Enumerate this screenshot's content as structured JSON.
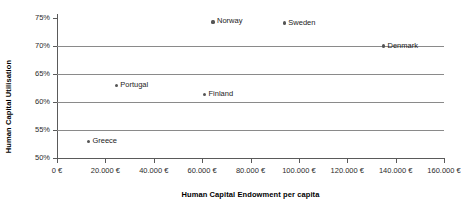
{
  "chart_data": {
    "type": "scatter",
    "title": "",
    "xlabel": "Human Capital Endowment per capita",
    "ylabel": "Human Capital Utilisation",
    "xlim": [
      0,
      160000
    ],
    "ylim": [
      50,
      75
    ],
    "grid": true,
    "gridlines_y": [
      55,
      60,
      65,
      70
    ],
    "legend": "none",
    "xticks": [
      0,
      20000,
      40000,
      60000,
      80000,
      100000,
      120000,
      140000,
      160000
    ],
    "xticklabels": [
      "0 €",
      "20.000 €",
      "40.000 €",
      "60.000 €",
      "80.000 €",
      "100.000 €",
      "120.000 €",
      "140.000 €",
      "160.000 €"
    ],
    "yticks": [
      50,
      55,
      60,
      65,
      70,
      75
    ],
    "yticklabels": [
      "50%",
      "55%",
      "60%",
      "65%",
      "70%",
      "75%"
    ],
    "points": [
      {
        "label": "Norway",
        "x": 64500,
        "y": 74.3
      },
      {
        "label": "Sweden",
        "x": 94000,
        "y": 74.1
      },
      {
        "label": "Denmark",
        "x": 135000,
        "y": 70.0
      },
      {
        "label": "Portugal",
        "x": 24500,
        "y": 63.0
      },
      {
        "label": "Finland",
        "x": 61000,
        "y": 61.4
      },
      {
        "label": "Greece",
        "x": 13000,
        "y": 53.0
      }
    ]
  },
  "colors": {
    "marker": "#555555",
    "gridline": "#8a8a8a",
    "axis": "#5a5a5a",
    "text": "#1c1c1c",
    "background": "#ffffff"
  }
}
